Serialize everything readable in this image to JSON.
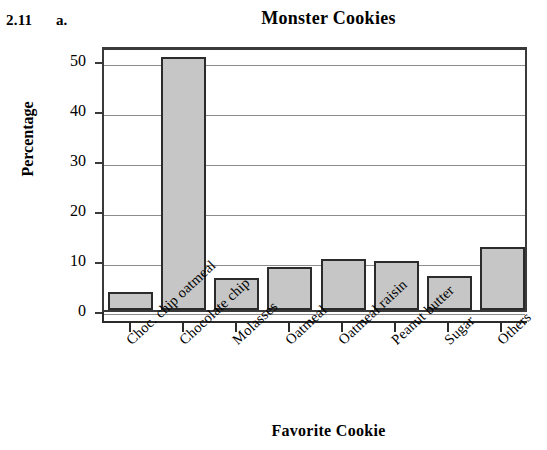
{
  "exercise": {
    "number": "2.11",
    "part": "a."
  },
  "chart_data": {
    "type": "bar",
    "title": "Monster Cookies",
    "xlabel": "Favorite Cookie",
    "ylabel": "Percentage",
    "categories": [
      "Choc. chip oatmeal",
      "Chocolate chip",
      "Molasses",
      "Oatmeal",
      "Oatmeal raisin",
      "Peanut butter",
      "Sugar",
      "Others"
    ],
    "values": [
      3.6,
      50.6,
      6.4,
      8.6,
      10.3,
      9.8,
      6.8,
      12.7
    ],
    "ylim": [
      0,
      53
    ],
    "yticks": [
      0,
      10,
      20,
      30,
      40,
      50
    ],
    "ytick_labels": [
      "0",
      "10",
      "20",
      "30",
      "40",
      "50"
    ],
    "grid": true,
    "legend": null,
    "bar_fill_color": "#c6c6c6",
    "bar_border_color": "#2b2b2b",
    "gridline_color": "#8c8c8c",
    "axis_color": "#3a3a3a"
  }
}
